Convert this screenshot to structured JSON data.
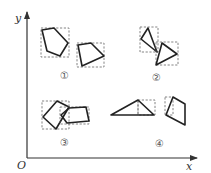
{
  "diagram": {
    "axes": {
      "x_label": "x",
      "y_label": "y",
      "origin_label": "O"
    },
    "groups": [
      {
        "id": "group-1",
        "label": "①",
        "description": "pentagon and quadrilateral, each with dashed bounding box, non-overlapping"
      },
      {
        "id": "group-2",
        "label": "②",
        "description": "two triangles touching at a vertex, dashed bounding boxes overlapping"
      },
      {
        "id": "group-3",
        "label": "③",
        "description": "two quadrilaterals overlapping, dashed bounding boxes overlapping"
      },
      {
        "id": "group-4",
        "label": "④",
        "description": "triangle with dashed box at apex and quadrilateral with dashed box at left"
      }
    ],
    "colors": {
      "shape_stroke": "#222222",
      "dashed_box": "#666666",
      "axis": "#333333",
      "background": "#ffffff"
    }
  }
}
